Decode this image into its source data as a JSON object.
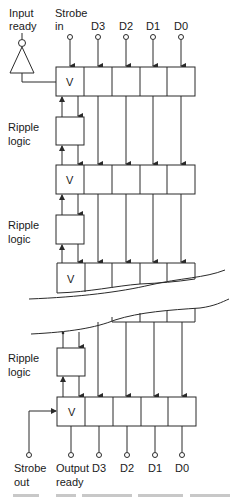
{
  "diagram": {
    "type": "FIFO register stack with ripple logic",
    "top_labels": {
      "input_ready_line1": "Input",
      "input_ready_line2": "ready",
      "strobe_in_line1": "Strobe",
      "strobe_in_line2": "in",
      "d3": "D3",
      "d2": "D2",
      "d1": "D1",
      "d0": "D0"
    },
    "registers": [
      {
        "valid_label": "V"
      },
      {
        "valid_label": "V"
      },
      {
        "valid_label": "V"
      },
      {
        "valid_label": "V"
      }
    ],
    "ripple_logic": [
      {
        "line1": "Ripple",
        "line2": "logic"
      },
      {
        "line1": "Ripple",
        "line2": "logic"
      },
      {
        "line1": "Ripple",
        "line2": "logic"
      }
    ],
    "bottom_labels": {
      "strobe_out_line1": "Strobe",
      "strobe_out_line2": "out",
      "output_ready_line1": "Output",
      "output_ready_line2": "ready",
      "d3": "D3",
      "d2": "D2",
      "d1": "D1",
      "d0": "D0"
    },
    "colors": {
      "line": "#2a2a2a",
      "background": "#ffffff"
    }
  }
}
